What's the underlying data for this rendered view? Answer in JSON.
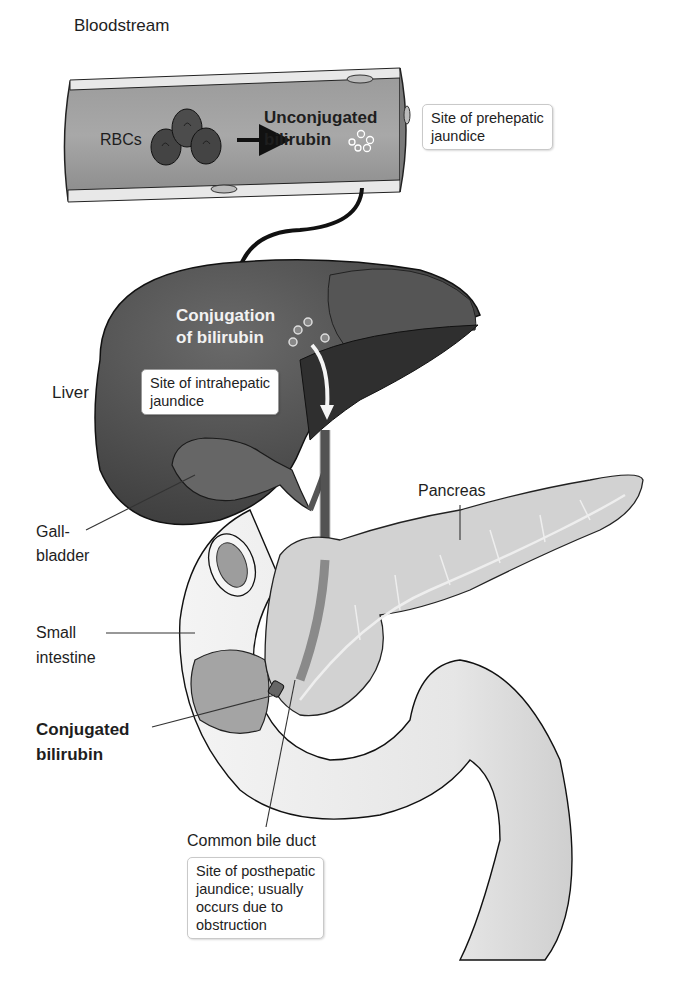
{
  "labels": {
    "bloodstream": "Bloodstream",
    "rbcs": "RBCs",
    "unconjugated_line1": "Unconjugated",
    "unconjugated_line2": "bilirubin",
    "conjugation_line1": "Conjugation",
    "conjugation_line2": "of bilirubin",
    "liver": "Liver",
    "gallbladder_line1": "Gall-",
    "gallbladder_line2": "bladder",
    "pancreas": "Pancreas",
    "small_intestine_line1": "Small",
    "small_intestine_line2": "intestine",
    "conjugated_line1": "Conjugated",
    "conjugated_line2": "bilirubin",
    "common_bile_duct": "Common bile duct"
  },
  "callouts": {
    "prehepatic": [
      "Site of prehepatic",
      "jaundice"
    ],
    "intrahepatic": [
      "Site of intrahepatic",
      "jaundice"
    ],
    "posthepatic": [
      "Site of posthepatic",
      "jaundice; usually",
      "occurs due to",
      "obstruction"
    ]
  },
  "colors": {
    "liver": "#4a4a4a",
    "liver_dark": "#2e2e2e",
    "vessel": "#8c8c8c",
    "pancreas": "#d4d4d4",
    "intestine": "#ececec",
    "outline": "#1a1a1a"
  }
}
